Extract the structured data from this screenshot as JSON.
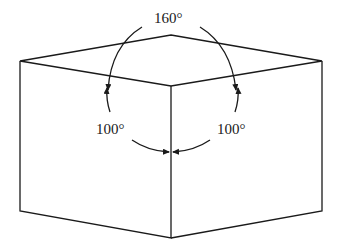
{
  "diagram": {
    "type": "cube-corner-angles",
    "labels": {
      "top_angle": "160°",
      "left_angle": "100°",
      "right_angle": "100°"
    },
    "colors": {
      "line": "#1a1a1a",
      "background": "#ffffff"
    }
  }
}
